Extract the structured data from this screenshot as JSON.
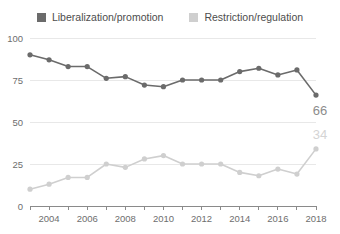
{
  "legend": {
    "position": "top-center",
    "entries": [
      {
        "label": "Liberalization/promotion",
        "color": "#6b6b6b",
        "icon": "square-swatch-icon"
      },
      {
        "label": "Restriction/regulation",
        "color": "#cfcfcf",
        "icon": "square-swatch-icon"
      }
    ]
  },
  "axes": {
    "y_ticks": [
      "0",
      "25",
      "50",
      "75",
      "100"
    ],
    "x_ticks": [
      "2004",
      "2006",
      "2008",
      "2010",
      "2012",
      "2014",
      "2016",
      "2018"
    ]
  },
  "end_labels": {
    "liberalization": "66",
    "restriction": "34"
  },
  "chart_data": {
    "type": "line",
    "title": "",
    "subtitle": "",
    "xlabel": "",
    "ylabel": "",
    "xlim": [
      2003,
      2018
    ],
    "ylim": [
      0,
      100
    ],
    "grid": true,
    "legend_position": "top-center",
    "x": [
      2003,
      2004,
      2005,
      2006,
      2007,
      2008,
      2009,
      2010,
      2011,
      2012,
      2013,
      2014,
      2015,
      2016,
      2017,
      2018
    ],
    "x_tick_labels": [
      "2004",
      "2006",
      "2008",
      "2010",
      "2012",
      "2014",
      "2016",
      "2018"
    ],
    "y_tick_values": [
      0,
      25,
      50,
      75,
      100
    ],
    "series": [
      {
        "name": "Liberalization/promotion",
        "color": "#6b6b6b",
        "values": [
          90,
          87,
          83,
          83,
          76,
          77,
          72,
          71,
          75,
          75,
          75,
          80,
          82,
          78,
          81,
          66
        ],
        "end_label": "66"
      },
      {
        "name": "Restriction/regulation",
        "color": "#cfcfcf",
        "values": [
          10,
          13,
          17,
          17,
          25,
          23,
          28,
          30,
          25,
          25,
          25,
          20,
          18,
          22,
          19,
          34
        ],
        "end_label": "34"
      }
    ]
  }
}
